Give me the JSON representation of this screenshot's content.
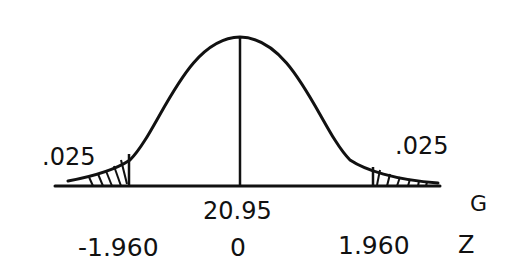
{
  "diagram": {
    "type": "normal-distribution-sketch",
    "left_tail_area": ".025",
    "right_tail_area": ".025",
    "center_value_g": "20.95",
    "g_axis_label": "G",
    "z_axis_label": "Z",
    "z_left": "-1.960",
    "z_center": "0",
    "z_right": "1.960",
    "colors": {
      "ink": "#111111",
      "background": "#ffffff"
    }
  }
}
